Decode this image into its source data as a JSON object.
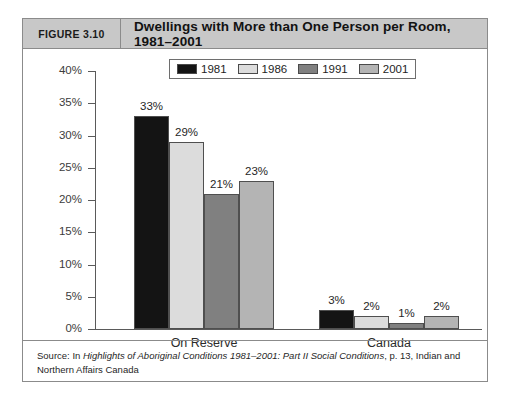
{
  "figure": {
    "number_label": "FIGURE 3.10",
    "title": "Dwellings with More than One Person per Room, 1981–2001",
    "source_prefix": "Source: In ",
    "source_italic": "Highlights of Aboriginal Conditions 1981–2001: Part II Social Conditions",
    "source_suffix": ", p. 13, Indian and Northern Affairs Canada"
  },
  "colors": {
    "header_band": "#c8c8c8",
    "frame": "#8b8b8b",
    "series_1981": "#141414",
    "series_1986": "#dcdcdc",
    "series_1991": "#808080",
    "series_2001": "#b4b4b4",
    "axis": "#5a5a5a",
    "text": "#1f1f1f"
  },
  "chart_data": {
    "type": "bar",
    "title": "Dwellings with More than One Person per Room, 1981–2001",
    "xlabel": "",
    "ylabel": "",
    "ylim": [
      0,
      40
    ],
    "ytick_values": [
      0,
      5,
      10,
      15,
      20,
      25,
      30,
      35,
      40
    ],
    "ytick_labels": [
      "0%",
      "5%",
      "10%",
      "15%",
      "20%",
      "25%",
      "30%",
      "35%",
      "40%"
    ],
    "grid": false,
    "legend_position": "top-center",
    "categories": [
      "On Reserve",
      "Canada"
    ],
    "series": [
      {
        "name": "1981",
        "color": "#141414",
        "values": [
          33,
          3
        ],
        "labels": [
          "33%",
          "3%"
        ]
      },
      {
        "name": "1986",
        "color": "#dcdcdc",
        "values": [
          29,
          2
        ],
        "labels": [
          "29%",
          "2%"
        ]
      },
      {
        "name": "1991",
        "color": "#808080",
        "values": [
          21,
          1
        ],
        "labels": [
          "21%",
          "1%"
        ]
      },
      {
        "name": "2001",
        "color": "#b4b4b4",
        "values": [
          23,
          2
        ],
        "labels": [
          "23%",
          "2%"
        ]
      }
    ]
  }
}
